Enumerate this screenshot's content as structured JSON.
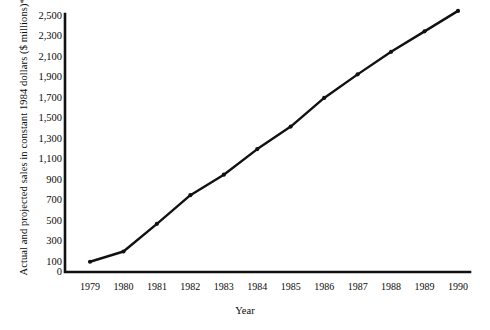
{
  "figure": {
    "top_strip_text": "",
    "background_color": "#ffffff",
    "line_color": "#111111",
    "axis_color": "#111111"
  },
  "chart_data": {
    "type": "line",
    "title": "",
    "xlabel": "Year",
    "ylabel": "Actual and projected sales in constant 1984 dollars ($ millions)*",
    "categories": [
      "1979",
      "1980",
      "1981",
      "1982",
      "1983",
      "1984",
      "1985",
      "1986",
      "1987",
      "1988",
      "1989",
      "1990"
    ],
    "x": [
      1979,
      1980,
      1981,
      1982,
      1983,
      1984,
      1985,
      1986,
      1987,
      1988,
      1989,
      1990
    ],
    "values": [
      100,
      200,
      470,
      750,
      950,
      1200,
      1420,
      1700,
      1930,
      2150,
      2350,
      2550
    ],
    "series": [
      {
        "name": "Actual and projected sales",
        "values": [
          100,
          200,
          470,
          750,
          950,
          1200,
          1420,
          1700,
          1930,
          2150,
          2350,
          2550
        ]
      }
    ],
    "ylim": [
      0,
      2500
    ],
    "xlim": [
      1979,
      1990
    ],
    "ytick_labels": [
      "0",
      "100",
      "300",
      "500",
      "700",
      "900",
      "1,100",
      "1,300",
      "1,500",
      "1,700",
      "1,900",
      "2,100",
      "2,300",
      "2,500"
    ],
    "ytick_values": [
      0,
      100,
      300,
      500,
      700,
      900,
      1100,
      1300,
      1500,
      1700,
      1900,
      2100,
      2300,
      2500
    ],
    "xtick_labels": [
      "1979",
      "1980",
      "1981",
      "1982",
      "1983",
      "1984",
      "1985",
      "1986",
      "1987",
      "1988",
      "1989",
      "1990"
    ],
    "grid": false,
    "legend": false,
    "markers": true,
    "footnote_marker": "*"
  }
}
